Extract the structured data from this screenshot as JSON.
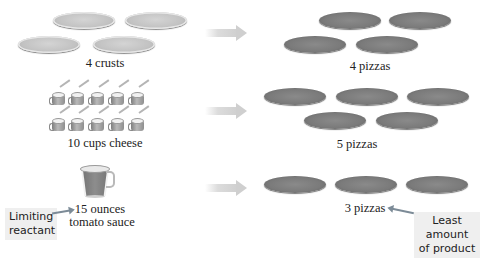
{
  "rows": [
    {
      "reactant_label": "4 crusts",
      "reactant_icon": "pizza-crust-icon",
      "reactant_count": 4,
      "product_label": "4 pizzas",
      "product_count": 4
    },
    {
      "reactant_label": "10 cups cheese",
      "reactant_icon": "cheese-cup-icon",
      "reactant_count": 10,
      "product_label": "5 pizzas",
      "product_count": 5
    },
    {
      "reactant_label_line1": "15 ounces",
      "reactant_label_line2": "tomato sauce",
      "reactant_icon": "measuring-cup-icon",
      "reactant_count": 1,
      "product_label": "3 pizzas",
      "product_count": 3
    }
  ],
  "callouts": {
    "limiting_line1": "Limiting",
    "limiting_line2": "reactant",
    "least_line1": "Least amount",
    "least_line2": "of product"
  },
  "colors": {
    "background": "#ffffff",
    "callout_bg": "#efefef",
    "pointer": "#7c8b97",
    "arrow": "#d0d0d0"
  }
}
